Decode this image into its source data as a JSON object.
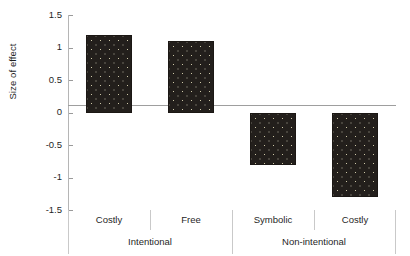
{
  "chart_data": {
    "type": "bar",
    "title": "",
    "subtitle": "",
    "xlabel": "",
    "ylabel": "Size of effect",
    "categories": [
      "Costly",
      "Free",
      "Symbolic",
      "Costly"
    ],
    "values": [
      1.2,
      1.1,
      -0.8,
      -1.3
    ],
    "series": [
      {
        "name": "Size of effect",
        "values": [
          1.2,
          1.1,
          -0.8,
          -1.3
        ]
      }
    ],
    "groups": [
      {
        "label": "Intentional",
        "categories": [
          "Costly",
          "Free"
        ]
      },
      {
        "label": "Non-intentional",
        "categories": [
          "Symbolic",
          "Costly"
        ]
      }
    ],
    "ylim": [
      -1.5,
      1.5
    ],
    "y_ticks": [
      "1.5",
      "1",
      "0.5",
      "0",
      "-0.5",
      "-1",
      "-1.5"
    ],
    "y_tick_values": [
      1.5,
      1,
      0.5,
      0,
      -0.5,
      -1,
      -1.5
    ],
    "grid": false,
    "legend": null,
    "legend_position": "none",
    "zero_line": true,
    "colors": {
      "bar_fill": "#231f1c",
      "bar_speckle": "#cfc9a8",
      "axis": "#b5b5b5",
      "zero_line": "#9e9e9e",
      "text": "#1f1f1f",
      "separator": "#c9c9c9",
      "background": "#ffffff"
    },
    "annotations": []
  }
}
